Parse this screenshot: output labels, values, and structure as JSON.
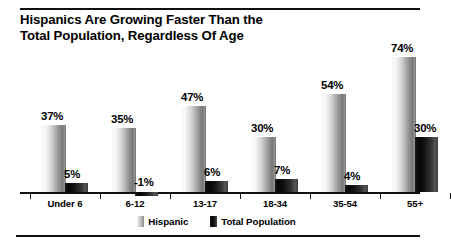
{
  "title": {
    "line1": "Hispanics Are Growing Faster Than the",
    "line2": "Total Population, Regardless Of Age"
  },
  "legend": {
    "items": [
      {
        "label": "Hispanic",
        "swatch": "light-gradient-swatch"
      },
      {
        "label": "Total Population",
        "swatch": "dark-gradient-swatch"
      }
    ]
  },
  "value_labels": {
    "hispanic": [
      "37%",
      "35%",
      "47%",
      "30%",
      "54%",
      "74%"
    ],
    "total": [
      "5%",
      "-1%",
      "6%",
      "7%",
      "4%",
      "30%"
    ]
  },
  "chart_data": {
    "type": "bar",
    "title": "Hispanics Are Growing Faster Than the Total Population, Regardless Of Age",
    "xlabel": "",
    "ylabel": "",
    "categories": [
      "Under 6",
      "6-12",
      "13-17",
      "18-34",
      "35-54",
      "55+"
    ],
    "series": [
      {
        "name": "Hispanic",
        "values": [
          37,
          35,
          47,
          30,
          54,
          74
        ]
      },
      {
        "name": "Total Population",
        "values": [
          5,
          -1,
          6,
          7,
          4,
          30
        ]
      }
    ],
    "value_format": "percent",
    "ylim": [
      -1,
      74
    ],
    "grid": false,
    "legend_position": "bottom-center",
    "baseline": 0
  }
}
